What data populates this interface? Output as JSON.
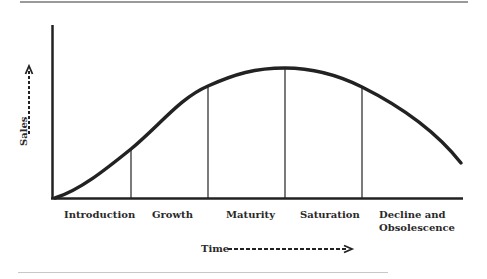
{
  "diagram": {
    "x_axis_label": "Time",
    "y_axis_label": "Sales",
    "stages": [
      {
        "label": "Introduction"
      },
      {
        "label": "Growth"
      },
      {
        "label": "Maturity"
      },
      {
        "label": "Saturation"
      },
      {
        "label": "Decline and",
        "label2": "Obsolescence"
      }
    ],
    "colors": {
      "line": "#222222",
      "rule": "#9a9a9a"
    }
  }
}
